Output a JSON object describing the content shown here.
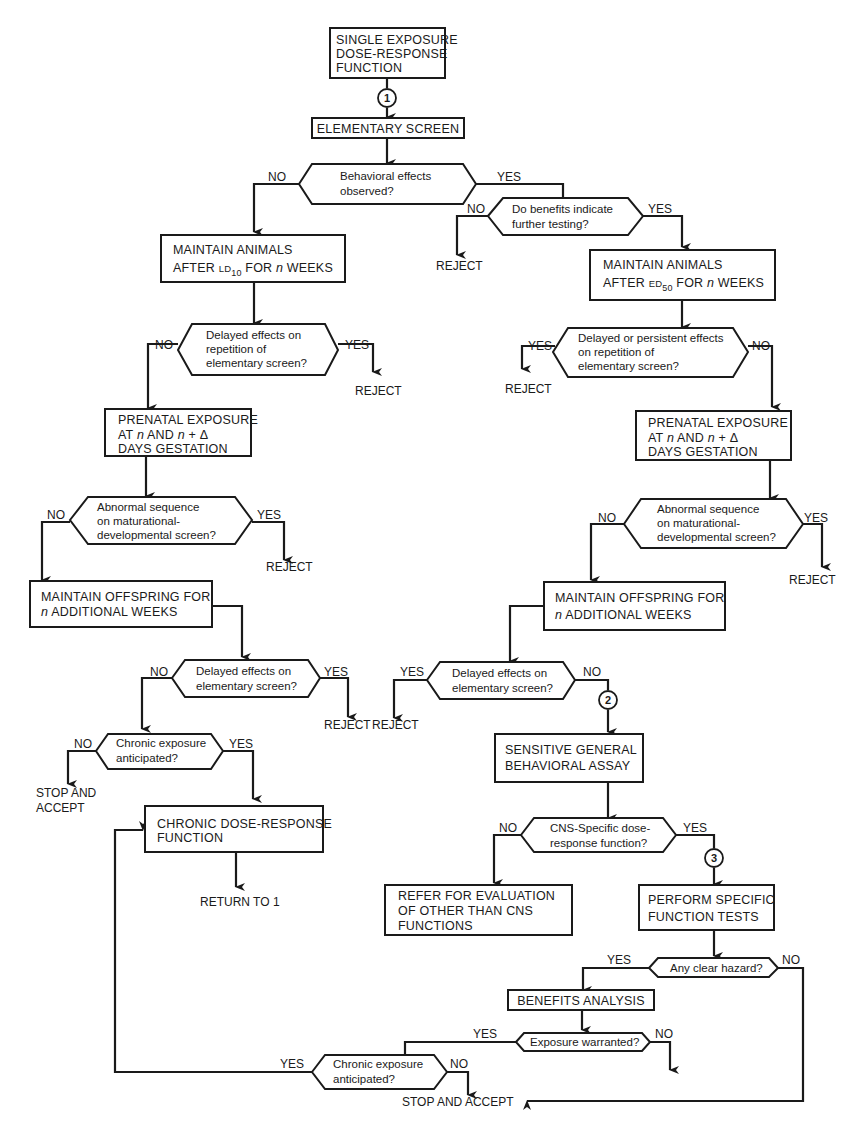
{
  "diagram": {
    "type": "flowchart",
    "connectors": {
      "c1": "1",
      "c2": "2",
      "c3": "3"
    },
    "nodes": {
      "start": {
        "line1": "SINGLE EXPOSURE",
        "line2": "DOSE-RESPONSE",
        "line3": "FUNCTION"
      },
      "elementary_screen": {
        "line1": "ELEMENTARY SCREEN"
      },
      "q_behavioral": {
        "line1": "Behavioral effects",
        "line2": "observed?",
        "no": "NO",
        "yes": "YES"
      },
      "q_benefits": {
        "line1": "Do benefits indicate",
        "line2": "further testing?",
        "no": "NO",
        "yes": "YES"
      },
      "reject_benefits": {
        "line1": "REJECT"
      },
      "maintain_ld10": {
        "line1": "MAINTAIN ANIMALS",
        "line2_pre": "AFTER ",
        "line2_abbr": "LD",
        "line2_sub": "10",
        "line2_post": " FOR ",
        "line2_n": "n",
        "line2_end": " WEEKS"
      },
      "maintain_ed50": {
        "line1": "MAINTAIN ANIMALS",
        "line2_pre": "AFTER ",
        "line2_abbr": "ED",
        "line2_sub": "50",
        "line2_post": " FOR ",
        "line2_n": "n",
        "line2_end": " WEEKS"
      },
      "q_delayed_left": {
        "line1": "Delayed effects on",
        "line2": "repetition of",
        "line3": "elementary screen?",
        "no": "NO",
        "yes": "YES"
      },
      "reject_delayed_left": {
        "line1": "REJECT"
      },
      "q_delayed_right": {
        "line1": "Delayed or persistent effects",
        "line2": "on repetition of",
        "line3": "elementary screen?",
        "no": "NO",
        "yes": "YES"
      },
      "reject_delayed_right": {
        "line1": "REJECT"
      },
      "prenatal_left": {
        "line1": "PRENATAL EXPOSURE",
        "line2_pre": "AT ",
        "line2_n": "n",
        "line2_mid": " AND ",
        "line2_n2": "n",
        "line2_end": " + Δ",
        "line3": "DAYS GESTATION"
      },
      "prenatal_right": {
        "line1": "PRENATAL EXPOSURE",
        "line2_pre": "AT ",
        "line2_n": "n",
        "line2_mid": " AND ",
        "line2_n2": "n",
        "line2_end": " + Δ",
        "line3": "DAYS GESTATION"
      },
      "q_abnormal_left": {
        "line1": "Abnormal sequence",
        "line2": "on maturational-",
        "line3": "developmental screen?",
        "no": "NO",
        "yes": "YES"
      },
      "reject_abnormal_left": {
        "line1": "REJECT"
      },
      "q_abnormal_right": {
        "line1": "Abnormal sequence",
        "line2": "on maturational-",
        "line3": "developmental screen?",
        "no": "NO",
        "yes": "YES"
      },
      "reject_abnormal_right": {
        "line1": "REJECT"
      },
      "offspring_left": {
        "line1": "MAINTAIN OFFSPRING FOR",
        "line2_n": "n",
        "line2_end": " ADDITIONAL WEEKS"
      },
      "offspring_right": {
        "line1": "MAINTAIN OFFSPRING FOR",
        "line2_n": "n",
        "line2_end": " ADDITIONAL WEEKS"
      },
      "q_delayed_elem_left": {
        "line1": "Delayed effects on",
        "line2": "elementary screen?",
        "no": "NO",
        "yes": "YES"
      },
      "reject_elem_left": {
        "line1": "REJECT"
      },
      "q_delayed_elem_right": {
        "line1": "Delayed effects on",
        "line2": "elementary screen?",
        "no": "NO",
        "yes": "YES"
      },
      "reject_elem_right": {
        "line1": "REJECT"
      },
      "q_chronic_left": {
        "line1": "Chronic exposure",
        "line2": "anticipated?",
        "no": "NO",
        "yes": "YES"
      },
      "stop_accept_left": {
        "line1": "STOP AND",
        "line2": "ACCEPT"
      },
      "chronic_dose": {
        "line1": "CHRONIC DOSE-RESPONSE",
        "line2": "FUNCTION"
      },
      "return_to_1": {
        "line1": "RETURN TO  1"
      },
      "sensitive_assay": {
        "line1": "SENSITIVE GENERAL",
        "line2": "BEHAVIORAL ASSAY"
      },
      "q_cns": {
        "line1": "CNS-Specific dose-",
        "line2": "response function?",
        "no": "NO",
        "yes": "YES"
      },
      "refer_eval": {
        "line1": "REFER FOR EVALUATION",
        "line2": "OF OTHER THAN CNS",
        "line3": "FUNCTIONS"
      },
      "specific_tests": {
        "line1": "PERFORM SPECIFIC",
        "line2": "FUNCTION TESTS"
      },
      "q_hazard": {
        "line1": "Any clear hazard?",
        "no": "NO",
        "yes": "YES"
      },
      "benefits_analysis": {
        "line1": "BENEFITS ANALYSIS"
      },
      "q_exposure": {
        "line1": "Exposure warranted?",
        "no": "NO",
        "yes": "YES"
      },
      "q_chronic_bottom": {
        "line1": "Chronic exposure",
        "line2": "anticipated?",
        "no": "NO",
        "yes": "YES"
      },
      "stop_accept_bottom": {
        "line1": "STOP AND ACCEPT"
      }
    }
  }
}
